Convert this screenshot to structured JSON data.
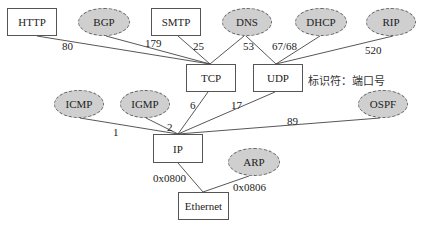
{
  "diagram": {
    "type": "protocol-multiplexing-tree",
    "note": "标识符：端口号",
    "nodes": {
      "http": "HTTP",
      "bgp": "BGP",
      "smtp": "SMTP",
      "dns": "DNS",
      "dhcp": "DHCP",
      "rip": "RIP",
      "tcp": "TCP",
      "udp": "UDP",
      "icmp": "ICMP",
      "igmp": "IGMP",
      "ospf": "OSPF",
      "ip": "IP",
      "arp": "ARP",
      "ethernet": "Ethernet"
    },
    "edges": [
      {
        "from": "HTTP",
        "to": "TCP",
        "label": "80"
      },
      {
        "from": "BGP",
        "to": "TCP",
        "label": "179"
      },
      {
        "from": "SMTP",
        "to": "TCP",
        "label": "25"
      },
      {
        "from": "DNS",
        "to": "TCP",
        "label": "53"
      },
      {
        "from": "DNS",
        "to": "UDP",
        "label": ""
      },
      {
        "from": "DHCP",
        "to": "UDP",
        "label": "67/68"
      },
      {
        "from": "RIP",
        "to": "UDP",
        "label": "520"
      },
      {
        "from": "ICMP",
        "to": "IP",
        "label": "1"
      },
      {
        "from": "IGMP",
        "to": "IP",
        "label": "2"
      },
      {
        "from": "TCP",
        "to": "IP",
        "label": "6"
      },
      {
        "from": "UDP",
        "to": "IP",
        "label": "17"
      },
      {
        "from": "OSPF",
        "to": "IP",
        "label": "89"
      },
      {
        "from": "IP",
        "to": "Ethernet",
        "label": "0x0800"
      },
      {
        "from": "ARP",
        "to": "Ethernet",
        "label": "0x0806"
      }
    ],
    "labels": {
      "e80": "80",
      "e179": "179",
      "e25": "25",
      "e53": "53",
      "e6768": "67/68",
      "e520": "520",
      "e1": "1",
      "e2": "2",
      "e6": "6",
      "e17": "17",
      "e89": "89",
      "e0800": "0x0800",
      "e0806": "0x0806"
    },
    "colors": {
      "box_border": "#555555",
      "ellipse_fill": "#cfcfcf",
      "ellipse_border": "#666666",
      "line": "#444444"
    }
  }
}
